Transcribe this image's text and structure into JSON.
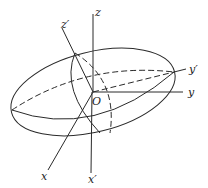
{
  "figure": {
    "labels": {
      "z": "z",
      "z_prime": "z′",
      "y": "y",
      "y_prime": "y′",
      "x": "x",
      "x_prime": "x′",
      "origin": "O"
    },
    "colors": {
      "stroke": "#2a2a2a",
      "background": "#ffffff"
    }
  }
}
